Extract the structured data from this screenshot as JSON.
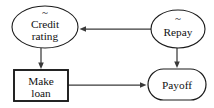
{
  "diagram": {
    "type": "influence-diagram",
    "title": "",
    "background_color": "#ffffff",
    "stroke_color": "#1a1a1a",
    "edge_color": "#3a3a3a",
    "nodes": [
      {
        "id": "credit-rating",
        "label_line1": "Credit",
        "label_line2": "rating",
        "shape": "ellipse",
        "role": "chance",
        "marker": "~",
        "cx": 45,
        "cy": 27,
        "rx": 33,
        "ry": 21
      },
      {
        "id": "repay",
        "label_line1": "Repay",
        "label_line2": "",
        "shape": "ellipse",
        "role": "chance",
        "marker": "~",
        "cx": 178,
        "cy": 29,
        "rx": 27,
        "ry": 19
      },
      {
        "id": "make-loan",
        "label_line1": "Make",
        "label_line2": "loan",
        "shape": "rectangle",
        "role": "decision",
        "marker": "",
        "x": 14,
        "y": 70,
        "width": 54,
        "height": 31
      },
      {
        "id": "payoff",
        "label_line1": "Payoff",
        "label_line2": "",
        "shape": "rounded-rectangle",
        "role": "utility",
        "marker": "",
        "x": 148,
        "y": 69,
        "width": 58,
        "height": 31,
        "corner_radius": 15.5
      }
    ],
    "edges": [
      {
        "id": "repay-to-credit-rating",
        "from": "repay",
        "to": "credit-rating",
        "direction": "left",
        "x1": 151,
        "y1": 29,
        "x2": 80,
        "y2": 29
      },
      {
        "id": "credit-rating-to-make-loan",
        "from": "credit-rating",
        "to": "make-loan",
        "direction": "down",
        "x1": 41,
        "y1": 48,
        "x2": 41,
        "y2": 68
      },
      {
        "id": "repay-to-payoff",
        "from": "repay",
        "to": "payoff",
        "direction": "down",
        "x1": 177,
        "y1": 48,
        "x2": 177,
        "y2": 67
      },
      {
        "id": "make-loan-to-payoff",
        "from": "make-loan",
        "to": "payoff",
        "direction": "right",
        "x1": 68,
        "y1": 85,
        "x2": 146,
        "y2": 85
      }
    ]
  }
}
